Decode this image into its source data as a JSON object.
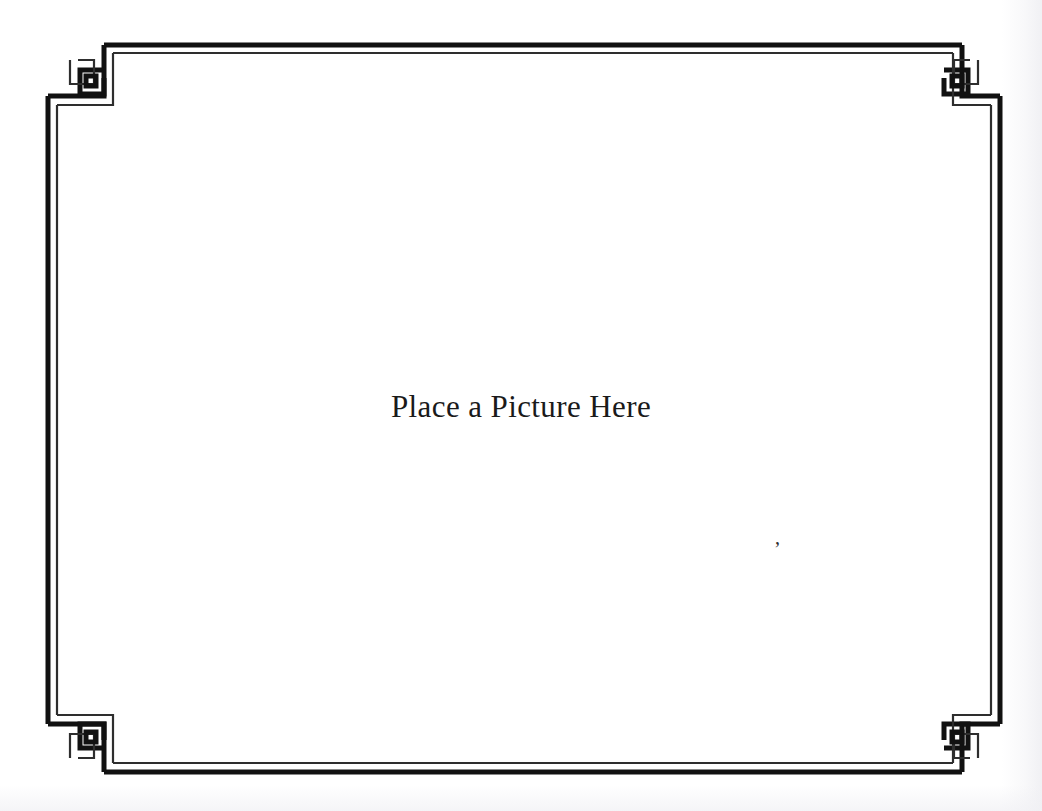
{
  "document": {
    "type": "decorative-picture-frame",
    "caption": "Place a Picture Here",
    "artifact_mark": ","
  },
  "frame": {
    "style_name": "greek-key-corner-frame",
    "line_color": "#111111",
    "thin_line_color": "#3a3a3a",
    "background_color": "#ffffff",
    "thick_line_width": 5,
    "thin_line_width": 2,
    "corner_ornaments": [
      {
        "name": "corner-ornament-top-left",
        "position": "top-left"
      },
      {
        "name": "corner-ornament-top-right",
        "position": "top-right"
      },
      {
        "name": "corner-ornament-bottom-left",
        "position": "bottom-left"
      },
      {
        "name": "corner-ornament-bottom-right",
        "position": "bottom-right"
      }
    ]
  },
  "page": {
    "background_color": "#fefefe",
    "width": 1042,
    "height": 811
  }
}
